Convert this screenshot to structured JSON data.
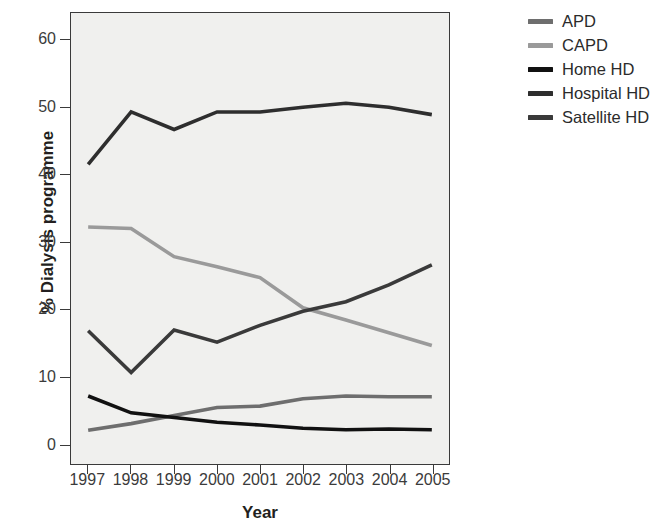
{
  "chart_data": {
    "type": "line",
    "title": "",
    "xlabel": "Year",
    "ylabel": "% Dialysis programme",
    "x": [
      1997,
      1998,
      1999,
      2000,
      2001,
      2002,
      2003,
      2004,
      2005
    ],
    "categories": [
      "1997",
      "1998",
      "1999",
      "2000",
      "2001",
      "2002",
      "2003",
      "2004",
      "2005"
    ],
    "xlim": [
      1996.6,
      2005.4
    ],
    "ylim": [
      -3,
      64
    ],
    "yticks": [
      0,
      10,
      20,
      30,
      40,
      50,
      60
    ],
    "ytick_labels": [
      "0",
      "10",
      "20",
      "30",
      "40",
      "50",
      "60"
    ],
    "grid": false,
    "legend_position": "right",
    "plot_background": "#f0f0ee",
    "axis_color": "#3a3a3a",
    "series": [
      {
        "name": "APD",
        "color": "#6e6e6e",
        "values": [
          2.0,
          3.0,
          4.2,
          5.4,
          5.6,
          6.7,
          7.1,
          7.0,
          7.0
        ]
      },
      {
        "name": "CAPD",
        "color": "#9a9a9a",
        "values": [
          32.2,
          32.0,
          27.8,
          26.3,
          24.7,
          20.2,
          18.4,
          16.5,
          14.6
        ]
      },
      {
        "name": "Home HD",
        "color": "#111111",
        "values": [
          7.1,
          4.6,
          3.9,
          3.2,
          2.8,
          2.3,
          2.1,
          2.2,
          2.1
        ]
      },
      {
        "name": "Hospital HD",
        "color": "#2e2e2e",
        "values": [
          41.5,
          49.3,
          46.7,
          49.3,
          49.3,
          50.0,
          50.6,
          50.0,
          48.9
        ]
      },
      {
        "name": "Satellite HD",
        "color": "#3a3a3a",
        "values": [
          16.8,
          10.6,
          16.9,
          15.1,
          17.6,
          19.7,
          21.1,
          23.6,
          26.6
        ]
      }
    ]
  },
  "legend": {
    "items": [
      {
        "label": "APD",
        "color": "#6e6e6e"
      },
      {
        "label": "CAPD",
        "color": "#9a9a9a"
      },
      {
        "label": "Home HD",
        "color": "#111111"
      },
      {
        "label": "Hospital HD",
        "color": "#2e2e2e"
      },
      {
        "label": "Satellite HD",
        "color": "#3a3a3a"
      }
    ]
  }
}
